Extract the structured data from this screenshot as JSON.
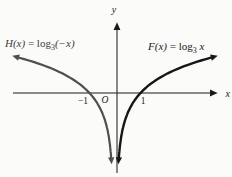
{
  "figure": {
    "y_axis_label": "y",
    "x_axis_label": "x",
    "origin_label": "O",
    "tick_minus1": "−1",
    "tick_1": "1",
    "h_label": {
      "name": "H(x)",
      "eq": " = log",
      "sub": "3",
      "arg": "(−x)"
    },
    "f_label": {
      "name": "F(x)",
      "eq": " = log",
      "sub": "3",
      "arg": " x"
    }
  },
  "chart_data": {
    "type": "line",
    "title": "",
    "xlabel": "x",
    "ylabel": "y",
    "grid": false,
    "legend_position": "labels-near-curves",
    "x_ticks": [
      -1,
      1
    ],
    "origin_label": "O",
    "base": 3,
    "series": [
      {
        "name": "F(x) = log_3 x",
        "expression": "y = log base 3 of x",
        "sign": 1,
        "x_domain": [
          0.08,
          4.0
        ],
        "color": "#161616",
        "zero_crossing": [
          1,
          0
        ],
        "asymptote": "x = 0 (curve falls to −∞ as x → 0+)",
        "arrow_ends": [
          "down along right side of y-axis",
          "up-right"
        ],
        "points": [
          {
            "x": 0.11,
            "y": -2.0
          },
          {
            "x": 0.33,
            "y": -1.0
          },
          {
            "x": 1.0,
            "y": 0.0
          },
          {
            "x": 3.0,
            "y": 1.0
          },
          {
            "x": 4.0,
            "y": 1.26
          }
        ]
      },
      {
        "name": "H(x) = log_3 (−x)",
        "expression": "y = log base 3 of (−x)",
        "sign": -1,
        "x_domain": [
          -4.0,
          -0.08
        ],
        "color": "#4f4f4f",
        "zero_crossing": [
          -1,
          0
        ],
        "asymptote": "x = 0 (curve falls to −∞ as x → 0−)",
        "arrow_ends": [
          "down along left side of y-axis",
          "up-left"
        ],
        "points": [
          {
            "x": -0.11,
            "y": -2.0
          },
          {
            "x": -0.33,
            "y": -1.0
          },
          {
            "x": -1.0,
            "y": 0.0
          },
          {
            "x": -3.0,
            "y": 1.0
          },
          {
            "x": -4.0,
            "y": 1.26
          }
        ]
      }
    ]
  }
}
